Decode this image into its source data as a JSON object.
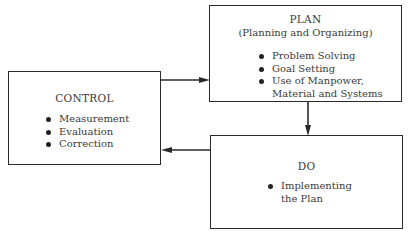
{
  "diagram": {
    "type": "flow",
    "nodes": {
      "plan": {
        "title": "PLAN",
        "subtitle": "(Planning and Organizing)",
        "items": [
          {
            "text": "Problem Solving"
          },
          {
            "text": "Goal Setting"
          },
          {
            "text": "Use of Manpower,",
            "continuation": "Material and Systems"
          }
        ]
      },
      "control": {
        "title": "CONTROL",
        "items": [
          {
            "text": "Measurement"
          },
          {
            "text": "Evaluation"
          },
          {
            "text": "Correction"
          }
        ]
      },
      "do": {
        "title": "DO",
        "items": [
          {
            "text": "Implementing",
            "continuation": "the Plan"
          }
        ]
      }
    },
    "edges": [
      {
        "from": "control",
        "to": "plan",
        "direction": "right"
      },
      {
        "from": "plan",
        "to": "do",
        "direction": "down"
      },
      {
        "from": "do",
        "to": "control",
        "direction": "left"
      }
    ],
    "colors": {
      "line": "#2a2a2a",
      "text": "#3a3a3a",
      "background": "#ffffff"
    }
  }
}
